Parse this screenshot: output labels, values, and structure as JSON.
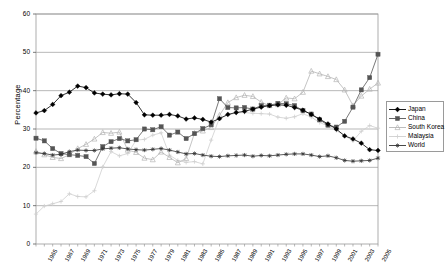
{
  "chart_data": {
    "type": "line",
    "title": "",
    "xlabel": "",
    "ylabel": "Percentage",
    "ylim": [
      0,
      60
    ],
    "ytick_step": 10,
    "yticks": [
      0,
      10,
      20,
      30,
      40,
      50,
      60
    ],
    "xlim": [
      1965,
      2006
    ],
    "grid": "horizontal",
    "legend_position": "right",
    "tick_labels": [
      "1965",
      "1967",
      "1969",
      "1971",
      "1973",
      "1975",
      "1977",
      "1979",
      "1981",
      "1983",
      "1985",
      "1987",
      "1989",
      "1991",
      "1993",
      "1995",
      "1997",
      "1999",
      "2001",
      "2003",
      "2005"
    ],
    "x": [
      1965,
      1966,
      1967,
      1968,
      1969,
      1970,
      1971,
      1972,
      1973,
      1974,
      1975,
      1976,
      1977,
      1978,
      1979,
      1980,
      1981,
      1982,
      1983,
      1984,
      1985,
      1986,
      1987,
      1988,
      1989,
      1990,
      1991,
      1992,
      1993,
      1994,
      1995,
      1996,
      1997,
      1998,
      1999,
      2000,
      2001,
      2002,
      2003,
      2004,
      2005,
      2006
    ],
    "series": [
      {
        "name": "Japan",
        "color": "#000000",
        "marker": "diamond",
        "values": [
          34.2,
          34.8,
          36.4,
          38.7,
          39.6,
          41.2,
          40.8,
          39.4,
          39.1,
          38.9,
          39.2,
          39.1,
          36.9,
          33.7,
          33.6,
          33.6,
          33.8,
          33.4,
          32.6,
          32.9,
          32.5,
          31.8,
          32.7,
          33.8,
          34.3,
          34.6,
          35.2,
          35.7,
          36.1,
          36.3,
          36.2,
          35.6,
          34.9,
          33.8,
          32.6,
          31.3,
          30.0,
          28.2,
          27.4,
          26.3,
          24.6,
          24.4
        ]
      },
      {
        "name": "China",
        "color": "#555555",
        "marker": "square",
        "values": [
          27.6,
          26.9,
          24.9,
          23.6,
          23.3,
          23.1,
          22.8,
          21.0,
          25.4,
          26.7,
          27.5,
          26.9,
          27.2,
          30.0,
          29.8,
          30.6,
          28.4,
          29.2,
          27.5,
          28.8,
          30.1,
          31.1,
          37.9,
          35.6,
          35.5,
          35.6,
          35.2,
          36.1,
          36.2,
          36.7,
          36.6,
          36.1,
          34.8,
          33.9,
          32.4,
          31.0,
          30.5,
          32.0,
          35.7,
          40.2,
          43.4,
          49.5
        ]
      },
      {
        "name": "South Korea",
        "color": "#b5b5b5",
        "marker": "triangle",
        "values": [
          24.2,
          23.3,
          22.6,
          22.3,
          23.3,
          24.9,
          26.0,
          27.4,
          29.1,
          28.9,
          29.2,
          24.5,
          23.9,
          22.4,
          22.0,
          24.0,
          22.6,
          21.2,
          22.3,
          28.9,
          29.5,
          30.4,
          33.6,
          36.9,
          38.2,
          38.8,
          38.5,
          37.0,
          36.1,
          36.4,
          38.1,
          37.9,
          39.6,
          45.1,
          44.4,
          43.7,
          42.9,
          40.2,
          36.1,
          38.6,
          40.4,
          42.0
        ]
      },
      {
        "name": "Malaysia",
        "color": "#cfcfcf",
        "marker": "cross",
        "values": [
          7.8,
          9.9,
          10.5,
          11.1,
          13.1,
          12.4,
          12.3,
          13.9,
          20.1,
          24.1,
          23.0,
          23.6,
          27.1,
          27.3,
          28.4,
          29.0,
          23.2,
          21.8,
          21.3,
          21.5,
          20.9,
          27.1,
          32.9,
          33.6,
          34.2,
          34.3,
          34.1,
          34.0,
          33.9,
          33.1,
          32.8,
          33.2,
          34.0,
          33.1,
          31.7,
          30.8,
          29.6,
          28.3,
          26.9,
          29.4,
          30.9,
          30.2
        ]
      },
      {
        "name": "World",
        "color": "#333333",
        "marker": "asterisk",
        "values": [
          23.8,
          23.6,
          23.2,
          23.4,
          24.1,
          24.5,
          24.4,
          24.4,
          24.8,
          25.0,
          25.1,
          24.8,
          24.6,
          24.5,
          24.7,
          24.9,
          24.5,
          24.0,
          23.5,
          23.6,
          23.2,
          22.9,
          22.8,
          23.0,
          23.1,
          23.2,
          22.9,
          23.1,
          23.0,
          23.2,
          23.4,
          23.5,
          23.5,
          23.2,
          22.8,
          23.0,
          22.5,
          21.8,
          21.6,
          21.7,
          21.8,
          22.4
        ]
      }
    ]
  },
  "legend": {
    "items": [
      {
        "label": "Japan"
      },
      {
        "label": "China"
      },
      {
        "label": "South Korea"
      },
      {
        "label": "Malaysia"
      },
      {
        "label": "World"
      }
    ]
  }
}
